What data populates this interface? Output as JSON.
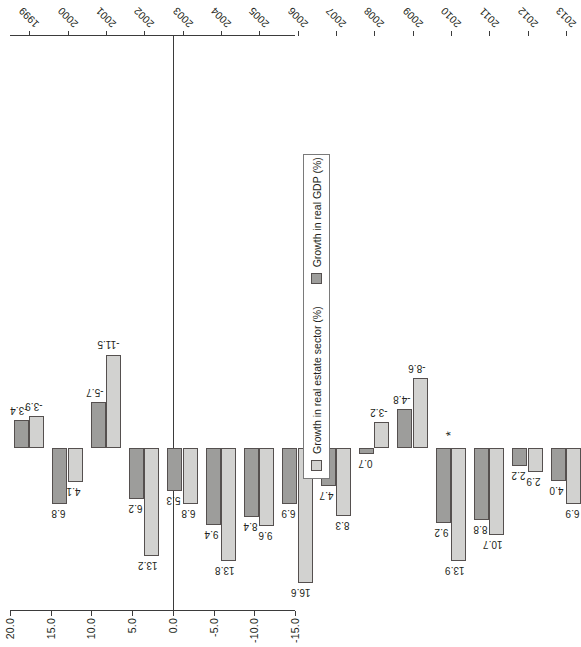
{
  "chart_data": {
    "type": "bar",
    "title": "",
    "subtitle": "",
    "xlabel": "",
    "ylabel": "",
    "orientation": "vertical-bars-rotated-90",
    "grid": false,
    "legend_position": "bottom-right",
    "categories": [
      "1999",
      "2000",
      "2001",
      "2002",
      "2003",
      "2004",
      "2005",
      "2006",
      "2007",
      "2008",
      "2009",
      "2010",
      "2011",
      "2012",
      "2013"
    ],
    "series": [
      {
        "name": "Growth in real estate sector (%)",
        "color": "#d2d2d0",
        "values": [
          -3.9,
          4.1,
          -11.5,
          13.2,
          6.8,
          13.8,
          9.6,
          16.6,
          8.3,
          -3.2,
          -8.6,
          13.9,
          10.7,
          2.9,
          6.9
        ]
      },
      {
        "name": "Growth in real GDP (%)",
        "color": "#9d9d9b",
        "values": [
          -3.4,
          6.8,
          -5.7,
          6.2,
          5.3,
          9.4,
          8.4,
          6.9,
          4.7,
          0.7,
          -4.8,
          9.2,
          8.8,
          2.2,
          4.0
        ]
      }
    ],
    "value_axis": {
      "ticks": [
        20.0,
        15.0,
        10.0,
        5.0,
        0.0,
        -5.0,
        -10.0,
        -15.0
      ],
      "tick_labels": [
        "20.0",
        "15.0",
        "10.0",
        "5.0",
        "0.0",
        "-5.0",
        "-10.0",
        "-15.0"
      ],
      "ylim": [
        20.0,
        -15.0
      ]
    },
    "data_labels": {
      "series_0": [
        "-3.9",
        "4.1",
        "-11.5",
        "13.2",
        "6.8",
        "13.8",
        "9.6",
        "16.6",
        "8.3",
        "-3.2",
        "-8.6",
        "13.9",
        "10.7",
        "2.9",
        "6.9"
      ],
      "series_1": [
        "-3.4",
        "6.8",
        "-5.7",
        "6.2",
        "5.3",
        "9.4",
        "8.4",
        "6.9",
        "4.7",
        "0.7",
        "-4.8",
        "9.2",
        "8.8",
        "2.2",
        "4.0"
      ]
    },
    "annotations": [
      {
        "text": "*",
        "category": "2010",
        "value": 0.0
      }
    ]
  },
  "legend": {
    "items": [
      {
        "label": "Growth in real estate sector (%)",
        "swatch": "s0"
      },
      {
        "label": "Growth in real GDP (%)",
        "swatch": "s1"
      }
    ]
  },
  "colors": {
    "series_real_estate": "#d2d2d0",
    "series_real_gdp": "#9d9d9b",
    "axis": "#3b3b3b",
    "text": "#231f20",
    "background": "#ffffff"
  }
}
